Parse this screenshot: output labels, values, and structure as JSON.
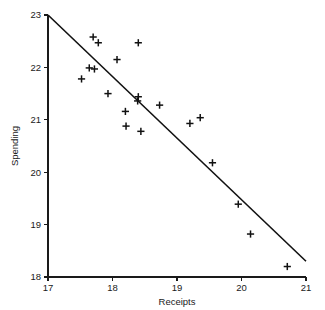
{
  "chart_data": {
    "type": "scatter",
    "title": "",
    "xlabel": "Receipts",
    "ylabel": "Spending",
    "xlim": [
      17,
      21
    ],
    "ylim": [
      18,
      23
    ],
    "xticks": [
      17,
      18,
      19,
      20,
      21
    ],
    "yticks": [
      18,
      19,
      20,
      21,
      22,
      23
    ],
    "xtick_labels": [
      "17",
      "18",
      "19",
      "20",
      "21"
    ],
    "ytick_labels": [
      "18",
      "19",
      "20",
      "21",
      "22",
      "23"
    ],
    "grid": false,
    "legend": null,
    "marker": "plus",
    "marker_color": "#111111",
    "points": [
      {
        "x": 17.52,
        "y": 21.78
      },
      {
        "x": 17.64,
        "y": 21.99
      },
      {
        "x": 17.7,
        "y": 22.58
      },
      {
        "x": 17.72,
        "y": 21.97
      },
      {
        "x": 17.78,
        "y": 22.47
      },
      {
        "x": 17.93,
        "y": 21.5
      },
      {
        "x": 18.07,
        "y": 22.15
      },
      {
        "x": 18.2,
        "y": 21.16
      },
      {
        "x": 18.21,
        "y": 20.88
      },
      {
        "x": 18.4,
        "y": 22.47
      },
      {
        "x": 18.4,
        "y": 21.44
      },
      {
        "x": 18.39,
        "y": 21.36
      },
      {
        "x": 18.44,
        "y": 20.78
      },
      {
        "x": 18.73,
        "y": 21.28
      },
      {
        "x": 19.2,
        "y": 20.93
      },
      {
        "x": 19.36,
        "y": 21.04
      },
      {
        "x": 19.55,
        "y": 20.18
      },
      {
        "x": 19.95,
        "y": 19.39
      },
      {
        "x": 20.14,
        "y": 18.82
      },
      {
        "x": 20.71,
        "y": 18.2
      }
    ],
    "fit_line": {
      "name": "regression-line",
      "x0": 17.0,
      "y0": 23.0,
      "x1": 21.0,
      "y1": 18.3
    }
  }
}
